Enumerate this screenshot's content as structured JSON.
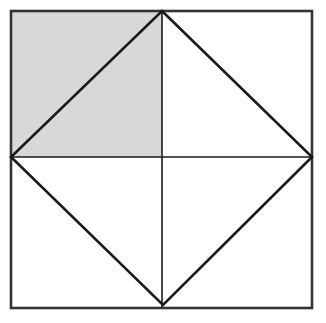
{
  "figure": {
    "title": "Square with inscribed diamond and shaded upper-left quadrant",
    "canvas": {
      "width": 326,
      "height": 323,
      "background": "#ffffff"
    },
    "colors": {
      "stroke": "#1a1a1a",
      "outer_border": "#333333",
      "shaded_fill": "#d8d8d8",
      "unshaded_fill": "#ffffff"
    },
    "stroke_widths": {
      "outer_border": 2.6,
      "diamond": 2.6,
      "midline": 1.6
    },
    "square": {
      "label": "outer-square",
      "left": 11,
      "top": 11,
      "right": 312,
      "bottom": 308,
      "width": 301,
      "height": 297,
      "corners": [
        [
          11,
          11
        ],
        [
          312,
          11
        ],
        [
          312,
          308
        ],
        [
          11,
          308
        ]
      ]
    },
    "diamond": {
      "label": "inscribed-diamond",
      "vertices": {
        "top": [
          162,
          11
        ],
        "right": [
          312,
          157
        ],
        "bottom": [
          163,
          305
        ],
        "left": [
          11,
          157
        ]
      },
      "points": "162,11 312,157 163,305 11,157"
    },
    "midlines": {
      "vertical": {
        "x": 162,
        "y1": 11,
        "y2": 307
      },
      "horizontal": {
        "y": 157,
        "x1": 11,
        "x2": 312
      }
    },
    "shaded_region": {
      "label": "upper-left-quadrant",
      "points": "11,11 162,11 162,157 11,157",
      "fill": "#d8d8d8",
      "description": "Upper-left quadrant of the square, bisected by the diamond edge from (11,157) to (162,11)"
    },
    "regions": [
      {
        "name": "upper-left-outer-triangle",
        "shaded": true,
        "points": "11,11 162,11 11,157"
      },
      {
        "name": "upper-left-inner-triangle",
        "shaded": true,
        "points": "11,157 162,11 162,157"
      },
      {
        "name": "upper-right-inner-triangle",
        "shaded": false,
        "points": "162,11 312,157 162,157"
      },
      {
        "name": "upper-right-outer-triangle",
        "shaded": false,
        "points": "162,11 312,11 312,157"
      },
      {
        "name": "lower-right-inner-triangle",
        "shaded": false,
        "points": "162,157 312,157 163,305"
      },
      {
        "name": "lower-right-outer-triangle",
        "shaded": false,
        "points": "312,157 312,308 163,305"
      },
      {
        "name": "lower-left-inner-triangle",
        "shaded": false,
        "points": "11,157 162,157 163,305"
      },
      {
        "name": "lower-left-outer-triangle",
        "shaded": false,
        "points": "11,157 163,305 11,308"
      }
    ]
  }
}
